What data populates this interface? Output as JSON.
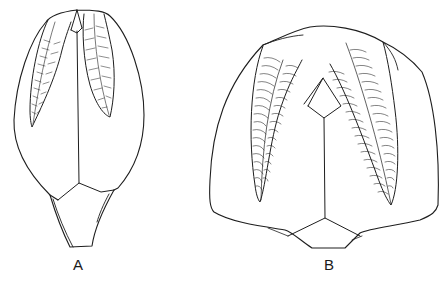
{
  "figure": {
    "panels": [
      {
        "id": "A",
        "label": "A"
      },
      {
        "id": "B",
        "label": "B"
      }
    ]
  },
  "colors": {
    "background": "#ffffff",
    "ink": "#1e1e1e"
  }
}
